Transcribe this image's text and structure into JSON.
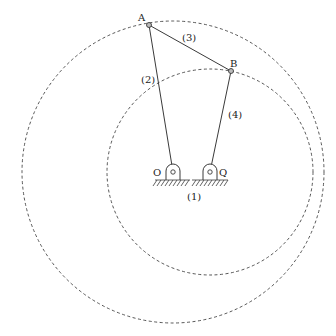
{
  "diagram": {
    "type": "four-bar-linkage",
    "colors": {
      "stroke": "#3a3a3a",
      "dashed": "#444444",
      "background": "#ffffff"
    },
    "points": {
      "A": {
        "label": "A",
        "x": 149,
        "y": 25
      },
      "B": {
        "label": "B",
        "x": 231,
        "y": 71
      },
      "O": {
        "label": "O",
        "x": 173,
        "y": 172
      },
      "Q": {
        "label": "Q",
        "x": 210,
        "y": 172
      }
    },
    "links": [
      {
        "id": "1",
        "label": "(1)",
        "from": "O",
        "to": "Q",
        "description": "ground"
      },
      {
        "id": "2",
        "label": "(2)",
        "from": "O",
        "to": "A"
      },
      {
        "id": "3",
        "label": "(3)",
        "from": "A",
        "to": "B"
      },
      {
        "id": "4",
        "label": "(4)",
        "from": "Q",
        "to": "B"
      }
    ],
    "circles": [
      {
        "name": "path-of-A",
        "cx": 173,
        "cy": 172,
        "r": 151
      },
      {
        "name": "path-of-B",
        "cx": 210,
        "cy": 172,
        "r": 103
      }
    ]
  }
}
